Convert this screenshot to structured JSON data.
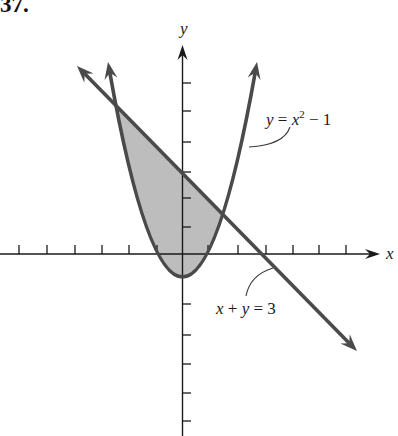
{
  "figure": {
    "number": "37.",
    "axes": {
      "x_label": "x",
      "y_label": "y",
      "x_tick_count": 12,
      "y_tick_count": 11
    },
    "parabola": {
      "equation": "y = x² − 1",
      "label_parts": {
        "lhs": "y",
        "eq": " = ",
        "base": "x",
        "exp": "2",
        "rest": " − 1"
      }
    },
    "line": {
      "equation": "x + y = 3",
      "label_parts": {
        "a": "x",
        "plus": " + ",
        "b": "y",
        "rest": " = 3"
      }
    },
    "shaded_region": {
      "fill": "#bdbdbd"
    },
    "colors": {
      "curve": "#4a4a4a",
      "axis": "#1a1a1a",
      "shade": "#bdbdbd",
      "background": "#ffffff"
    }
  }
}
